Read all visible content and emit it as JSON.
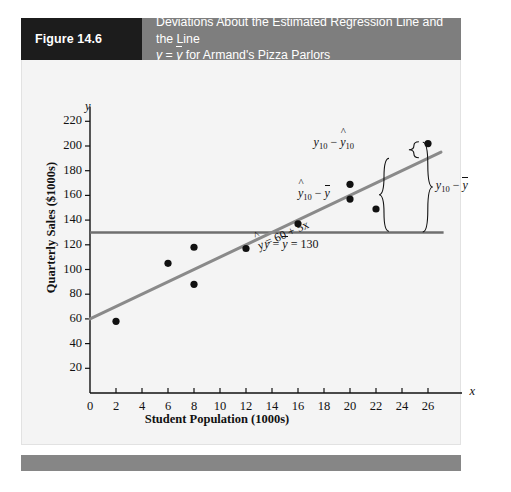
{
  "figure": {
    "tag": "Figure 14.6",
    "caption_line1": "Deviations About the Estimated Regression Line and the Line",
    "caption_line2_prefix": "y",
    "caption_line2_eq": "=",
    "caption_line2_ybar": "y",
    "caption_line2_suffix": "for Armand's Pizza Parlors",
    "tag_bg": "#1c1c1c",
    "caption_bg": "#7e7e7e",
    "panel_bg": "#f4f4f4",
    "footer_bg": "#868686"
  },
  "chart_data": {
    "type": "scatter",
    "xlabel": "Student Population (1000s)",
    "ylabel": "Quarterly Sales ($1000s)",
    "x_axis_name": "x",
    "y_axis_name": "y",
    "xlim": [
      0,
      28
    ],
    "ylim": [
      0,
      230
    ],
    "xticks": [
      0,
      2,
      4,
      6,
      8,
      10,
      12,
      14,
      16,
      18,
      20,
      22,
      24,
      26
    ],
    "yticks": [
      20,
      40,
      60,
      80,
      100,
      120,
      140,
      160,
      180,
      200,
      220
    ],
    "grid": false,
    "points": [
      {
        "x": 2,
        "y": 58
      },
      {
        "x": 6,
        "y": 105
      },
      {
        "x": 8,
        "y": 88
      },
      {
        "x": 8,
        "y": 118
      },
      {
        "x": 12,
        "y": 117
      },
      {
        "x": 16,
        "y": 137
      },
      {
        "x": 20,
        "y": 157
      },
      {
        "x": 20,
        "y": 169
      },
      {
        "x": 22,
        "y": 149
      },
      {
        "x": 26,
        "y": 202
      }
    ],
    "point_color": "#111111",
    "regression_line": {
      "label": "= 60 + 5x",
      "label_hat": "y",
      "intercept": 60,
      "slope": 5,
      "x_from": 0,
      "x_to": 27,
      "color": "#8a8a8a"
    },
    "mean_line": {
      "label_parts": {
        "y": "y",
        "eq1": "=",
        "ybar": "y",
        "eq2": "=",
        "value": "130"
      },
      "value": 130,
      "x_from": 0,
      "x_to": 27,
      "color": "#6f6f6f"
    },
    "annotations": [
      {
        "name": "residual-deviation",
        "text_y": "y",
        "sub_y": "10",
        "minus": "−",
        "text_yhat": "y",
        "sub_yhat": "10"
      },
      {
        "name": "explained-deviation",
        "text_yhat": "y",
        "sub_yhat": "10",
        "minus": "−",
        "text_ybar": "y"
      },
      {
        "name": "total-deviation",
        "text_y": "y",
        "sub_y": "10",
        "minus": "−",
        "text_ybar": "y"
      }
    ]
  }
}
